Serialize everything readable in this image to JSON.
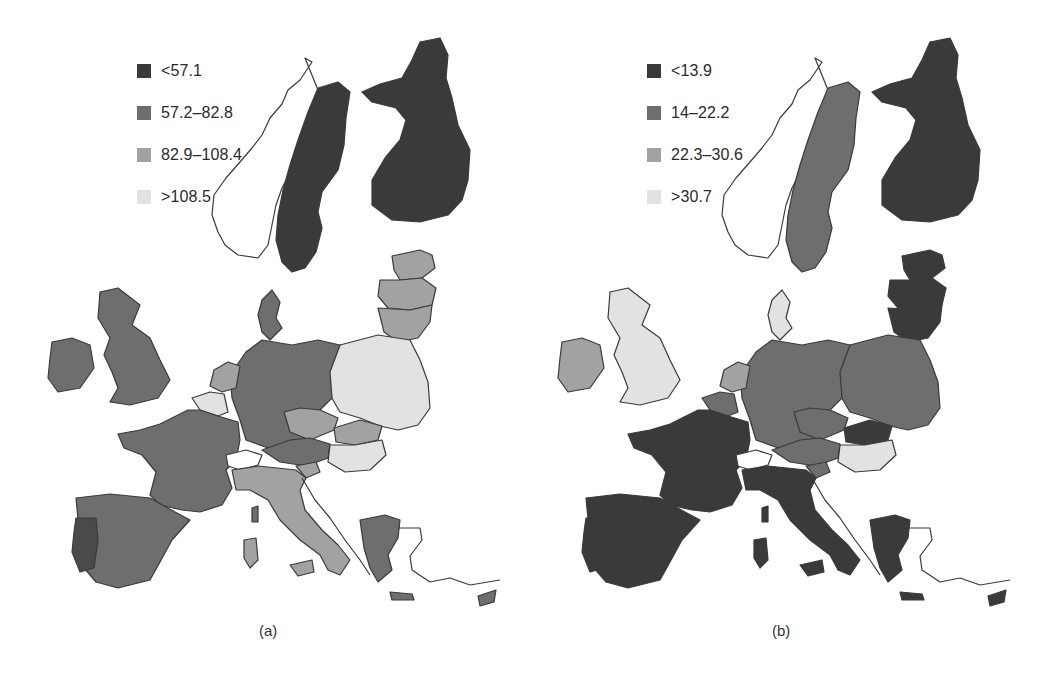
{
  "panels": [
    {
      "id": "a",
      "caption": "(a)",
      "legend": [
        {
          "label": "<57.1",
          "color": "#3a3a3a"
        },
        {
          "label": "57.2–82.8",
          "color": "#6e6e6e"
        },
        {
          "label": "82.9–108.4",
          "color": "#a2a2a2"
        },
        {
          "label": ">108.5",
          "color": "#e2e2e2"
        }
      ],
      "countries": {
        "norway": "none",
        "sweden": "#3a3a3a",
        "finland": "#3a3a3a",
        "estonia": "#a2a2a2",
        "latvia": "#a2a2a2",
        "lithuania": "#a2a2a2",
        "poland": "#e2e2e2",
        "germany": "#6e6e6e",
        "denmark": "#6e6e6e",
        "netherlands": "#a2a2a2",
        "belgium": "#e2e2e2",
        "luxembourg": "#6e6e6e",
        "france": "#6e6e6e",
        "spain": "#6e6e6e",
        "portugal": "#4a4a4a",
        "uk": "#6e6e6e",
        "ireland": "#6e6e6e",
        "czechia": "#a2a2a2",
        "slovakia": "#a2a2a2",
        "austria": "#6e6e6e",
        "hungary": "#e2e2e2",
        "slovenia": "#a2a2a2",
        "italy": "#a2a2a2",
        "sardinia": "#a2a2a2",
        "sicily": "#a2a2a2",
        "corsica": "#6e6e6e",
        "greece": "#6e6e6e",
        "switzerland": "none",
        "cyprus": "#6e6e6e",
        "crete": "#6e6e6e",
        "malta": "#6e6e6e"
      }
    },
    {
      "id": "b",
      "caption": "(b)",
      "legend": [
        {
          "label": "<13.9",
          "color": "#3a3a3a"
        },
        {
          "label": "14–22.2",
          "color": "#6e6e6e"
        },
        {
          "label": "22.3–30.6",
          "color": "#a2a2a2"
        },
        {
          "label": ">30.7",
          "color": "#e2e2e2"
        }
      ],
      "countries": {
        "norway": "none",
        "sweden": "#6e6e6e",
        "finland": "#3a3a3a",
        "estonia": "#3a3a3a",
        "latvia": "#3a3a3a",
        "lithuania": "#3a3a3a",
        "poland": "#6e6e6e",
        "germany": "#6e6e6e",
        "denmark": "#e2e2e2",
        "netherlands": "#a2a2a2",
        "belgium": "#6e6e6e",
        "luxembourg": "#6e6e6e",
        "france": "#3a3a3a",
        "spain": "#3a3a3a",
        "portugal": "#3a3a3a",
        "uk": "#e2e2e2",
        "ireland": "#a2a2a2",
        "czechia": "#6e6e6e",
        "slovakia": "#3a3a3a",
        "austria": "#6e6e6e",
        "hungary": "#e2e2e2",
        "slovenia": "#6e6e6e",
        "italy": "#3a3a3a",
        "sardinia": "#3a3a3a",
        "sicily": "#3a3a3a",
        "corsica": "#3a3a3a",
        "greece": "#3a3a3a",
        "switzerland": "none",
        "cyprus": "#3a3a3a",
        "crete": "#3a3a3a",
        "malta": "#3a3a3a"
      }
    }
  ]
}
